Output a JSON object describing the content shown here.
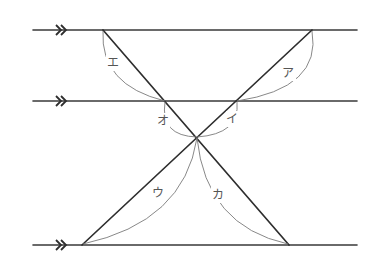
{
  "figure": {
    "parallel_marker": "double-arrow (>>)",
    "parallel_lines": [
      {
        "name": "top",
        "y": 30,
        "x1": 33,
        "x2": 357
      },
      {
        "name": "middle",
        "y": 101,
        "x1": 33,
        "x2": 357
      },
      {
        "name": "bottom",
        "y": 245,
        "x1": 33,
        "x2": 357
      }
    ],
    "transversals": [
      {
        "name": "left-to-right-down",
        "from": [
          103,
          30
        ],
        "to": [
          289,
          245
        ]
      },
      {
        "name": "right-to-left-down",
        "from": [
          312,
          30
        ],
        "to": [
          82,
          245
        ]
      }
    ],
    "crossing_point": [
      197,
      137
    ],
    "angle_labels": {
      "a": "ア",
      "i": "イ",
      "u": "ウ",
      "e": "エ",
      "o": "オ",
      "ka": "カ"
    }
  }
}
